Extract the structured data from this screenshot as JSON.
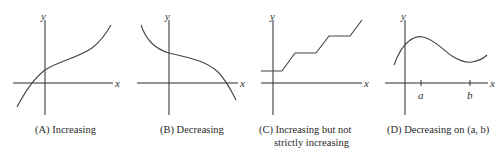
{
  "panels": [
    {
      "id": "A",
      "caption": "(A) Increasing",
      "axis_labels": {
        "x": "x",
        "y": "y"
      },
      "curve_type": "increasing"
    },
    {
      "id": "B",
      "caption": "(B) Decreasing",
      "axis_labels": {
        "x": "x",
        "y": "y"
      },
      "curve_type": "decreasing"
    },
    {
      "id": "C",
      "caption_line1": "(C) Increasing but not",
      "caption_line2": "strictly increasing",
      "axis_labels": {
        "x": "x",
        "y": "y"
      },
      "curve_type": "step-increasing"
    },
    {
      "id": "D",
      "caption": "(D) Decreasing on (a, b)",
      "axis_labels": {
        "x": "x",
        "y": "y"
      },
      "ticks": {
        "a": "a",
        "b": "b"
      },
      "curve_type": "decreasing-on-interval"
    }
  ],
  "colors": {
    "axis": "#2a2a2a",
    "curve": "#444444",
    "text": "#2a2a2a"
  }
}
